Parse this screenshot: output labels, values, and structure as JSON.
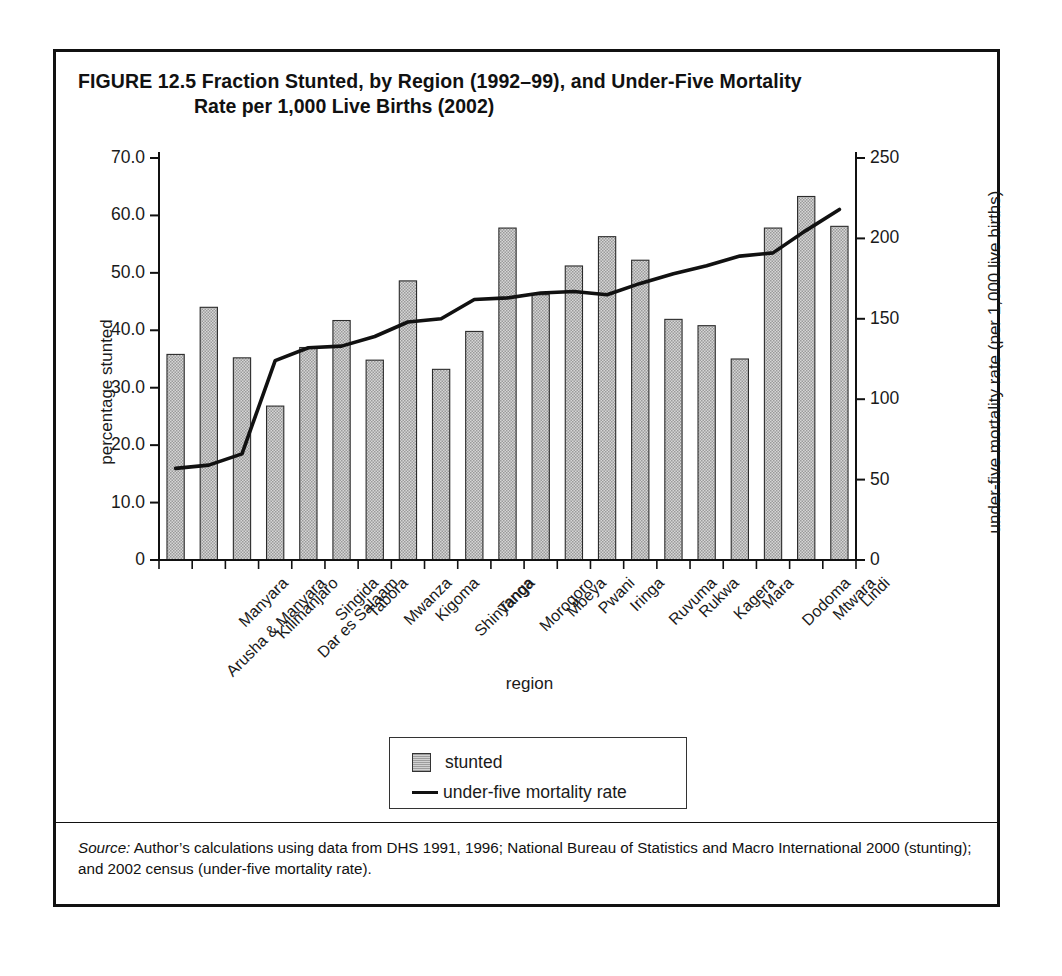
{
  "figure": {
    "number": "FIGURE 12.5",
    "title_line1": "Fraction Stunted, by Region (1992–99), and Under-Five Mortality",
    "title_line2": "Rate per 1,000 Live Births (2002)",
    "source_label": "Source:",
    "source_text": " Author’s calculations using data from DHS 1991, 1996; National Bureau of Statistics and Macro International 2000 (stunting); and 2002 census (under-five mortality rate)."
  },
  "legend": {
    "bar_label": "stunted",
    "line_label": "under-five mortality rate"
  },
  "chart_data": {
    "type": "bar",
    "title": "FIGURE 12.5 Fraction Stunted, by Region (1992–99), and Under-Five Mortality Rate per 1,000 Live Births (2002)",
    "xlabel": "region",
    "ylabel": "percentage stunted",
    "y2label": "under-five mortality rate (per 1,000 live births)",
    "ylim": [
      0,
      70
    ],
    "y2lim": [
      0,
      250
    ],
    "yticks": [
      "0",
      "10.0",
      "20.0",
      "30.0",
      "40.0",
      "50.0",
      "60.0",
      "70.0"
    ],
    "ytick_values": [
      0,
      10,
      20,
      30,
      40,
      50,
      60,
      70
    ],
    "y2ticks": [
      "0",
      "50",
      "100",
      "150",
      "200",
      "250"
    ],
    "y2tick_values": [
      0,
      50,
      100,
      150,
      200,
      250
    ],
    "grid": false,
    "legend_position": "bottom-center",
    "categories": [
      "Arusha & Manyara",
      "Manyara",
      "Kilimanjaro",
      "Dar es Salaam",
      "Singida",
      "Tabora",
      "Mwanza",
      "Kigoma",
      "Shinyanga",
      "Tanga",
      "Morogoro",
      "Mbeya",
      "Pwani",
      "Iringa",
      "Ruvuma",
      "Rukwa",
      "Kagera",
      "Mara",
      "Dodoma",
      "Mtwara",
      "Lindi"
    ],
    "series": [
      {
        "name": "stunted",
        "axis": "left",
        "type": "bar",
        "color": "#c8c8c8",
        "values": [
          35.8,
          44.0,
          35.2,
          26.8,
          37.0,
          41.7,
          34.8,
          48.6,
          33.2,
          39.8,
          57.8,
          46.2,
          51.2,
          56.3,
          52.2,
          41.9,
          40.8,
          35.0,
          57.8,
          63.3,
          58.1
        ]
      },
      {
        "name": "under-five mortality rate",
        "axis": "right",
        "type": "line",
        "color": "#111111",
        "values": [
          57,
          59,
          66,
          124,
          132,
          133,
          139,
          148,
          150,
          162,
          163,
          166,
          167,
          165,
          172,
          178,
          183,
          189,
          191,
          205,
          218
        ]
      }
    ]
  }
}
